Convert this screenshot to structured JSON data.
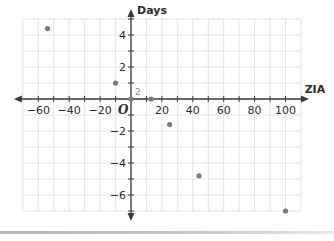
{
  "chart_data": {
    "type": "scatter",
    "title": "",
    "xlabel": "ZIA",
    "ylabel": "Days",
    "origin_label": "O",
    "xlim": [
      -70,
      110
    ],
    "ylim": [
      -7,
      5
    ],
    "grid": true,
    "x_grid_step": 10,
    "y_grid_step": 1,
    "x_ticks": [
      -60,
      -40,
      -20,
      20,
      40,
      60,
      80,
      100
    ],
    "x_tick_labels": [
      "−60",
      "−40",
      "−20",
      "20",
      "40",
      "60",
      "80",
      "100"
    ],
    "y_ticks": [
      4,
      2,
      -2,
      -4,
      -6
    ],
    "y_tick_labels": [
      "4",
      "2",
      "−2",
      "−4",
      "−6"
    ],
    "points": [
      {
        "x": -54,
        "y": 4.4
      },
      {
        "x": -10,
        "y": 1
      },
      {
        "x": 0,
        "y": 0
      },
      {
        "x": 13,
        "y": 0
      },
      {
        "x": 25,
        "y": -1.6
      },
      {
        "x": 44,
        "y": -4.8
      },
      {
        "x": 100,
        "y": -7
      }
    ],
    "annotations": [
      {
        "text": "2",
        "x": 0,
        "y": 0,
        "note": "count of points at origin"
      }
    ],
    "point_color": "#7a7a7a",
    "grid_color": "#e3e3e3",
    "axis_color": "#3a3a3a"
  }
}
